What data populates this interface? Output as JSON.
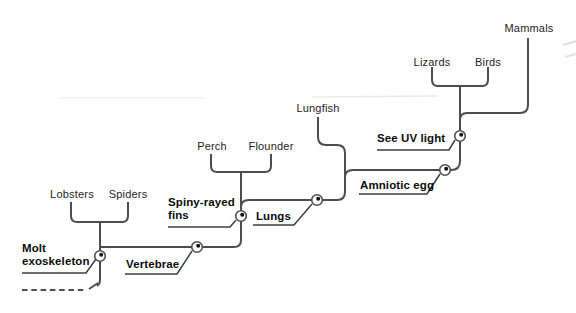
{
  "figure": {
    "type": "cladogram",
    "taxa": [
      {
        "label": "Lobsters"
      },
      {
        "label": "Spiders"
      },
      {
        "label": "Perch"
      },
      {
        "label": "Flounder"
      },
      {
        "label": "Lungfish"
      },
      {
        "label": "Lizards"
      },
      {
        "label": "Birds"
      },
      {
        "label": "Mammals"
      }
    ],
    "traits": [
      {
        "label": "Molt exoskeleton"
      },
      {
        "label": "Vertebrae"
      },
      {
        "label": "Spiny-rayed fins"
      },
      {
        "label": "Lungs"
      },
      {
        "label": "Amniotic egg"
      },
      {
        "label": "See UV light"
      }
    ],
    "structure": {
      "trait_order_from_root": [
        "Molt exoskeleton",
        "Vertebrae",
        "Spiny-rayed fins",
        "Lungs",
        "Amniotic egg",
        "See UV light"
      ],
      "sister_pairs": [
        [
          "Lobsters",
          "Spiders"
        ],
        [
          "Perch",
          "Flounder"
        ],
        [
          "Lizards",
          "Birds"
        ]
      ],
      "root": "dashed line continuing off bottom-left"
    },
    "colors": {
      "line": "#4d4d4d",
      "text": "#1d1d1d",
      "trait_text": "#0d0d0d",
      "node_dot": "#151515",
      "background": "#ffffff"
    }
  }
}
